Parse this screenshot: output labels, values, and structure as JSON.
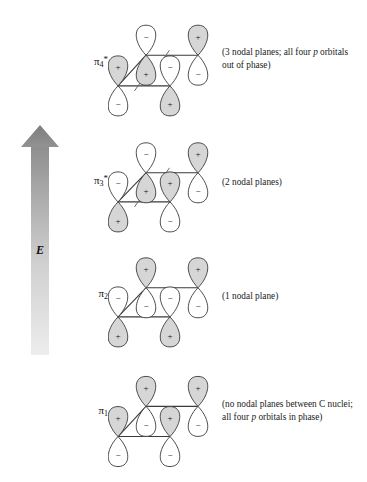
{
  "figure": {
    "background_color": "#ffffff",
    "line_color": "#3a3a3a",
    "lobe_fill_positive": "#d6d6d6",
    "lobe_fill_negative": "#ffffff",
    "arrow_color_top": "#8c8c8c",
    "arrow_color_bottom": "#e8e8e8"
  },
  "energy_axis": {
    "label": "E",
    "name": "energy-arrow",
    "direction": "up"
  },
  "orbitals": [
    {
      "id": "pi4-star",
      "label_base": "π",
      "label_sub": "4",
      "label_sup": "*",
      "caption": "(3 nodal planes; all four p orbitals out of phase)",
      "caption_parts": [
        {
          "text": "(3 nodal planes; all four ",
          "italic": false
        },
        {
          "text": "p",
          "italic": true
        },
        {
          "text": " orbitals out of phase)",
          "italic": false
        }
      ],
      "nodal_planes": 3,
      "node_marks": 2,
      "lobes": {
        "back_left_top": "−",
        "back_left_bottom": "+",
        "back_right_top": "+",
        "back_right_bottom": "−",
        "front_left_top": "+",
        "front_left_bottom": "−",
        "front_right_top": "−",
        "front_right_bottom": "+"
      }
    },
    {
      "id": "pi3-star",
      "label_base": "π",
      "label_sub": "3",
      "label_sup": "*",
      "caption": "(2 nodal planes)",
      "caption_parts": [
        {
          "text": "(2 nodal planes)",
          "italic": false
        }
      ],
      "nodal_planes": 2,
      "node_marks": 2,
      "lobes": {
        "back_left_top": "−",
        "back_left_bottom": "+",
        "back_right_top": "+",
        "back_right_bottom": "−",
        "front_left_top": "−",
        "front_left_bottom": "+",
        "front_right_top": "+",
        "front_right_bottom": "−"
      }
    },
    {
      "id": "pi2",
      "label_base": "π",
      "label_sub": "2",
      "label_sup": "",
      "caption": "(1 nodal plane)",
      "caption_parts": [
        {
          "text": "(1 nodal plane)",
          "italic": false
        }
      ],
      "nodal_planes": 1,
      "node_marks": 0,
      "lobes": {
        "back_left_top": "+",
        "back_left_bottom": "−",
        "back_right_top": "+",
        "back_right_bottom": "−",
        "front_left_top": "−",
        "front_left_bottom": "+",
        "front_right_top": "−",
        "front_right_bottom": "+"
      }
    },
    {
      "id": "pi1",
      "label_base": "π",
      "label_sub": "1",
      "label_sup": "",
      "caption": "(no nodal planes between C nuclei; all four p orbitals in phase)",
      "caption_parts": [
        {
          "text": "(no nodal planes between C nuclei; all four ",
          "italic": false
        },
        {
          "text": "p",
          "italic": true
        },
        {
          "text": " orbitals in phase)",
          "italic": false
        }
      ],
      "nodal_planes": 0,
      "node_marks": 0,
      "lobes": {
        "back_left_top": "+",
        "back_left_bottom": "−",
        "back_right_top": "+",
        "back_right_bottom": "−",
        "front_left_top": "+",
        "front_left_bottom": "−",
        "front_right_top": "+",
        "front_right_bottom": "−"
      }
    }
  ]
}
